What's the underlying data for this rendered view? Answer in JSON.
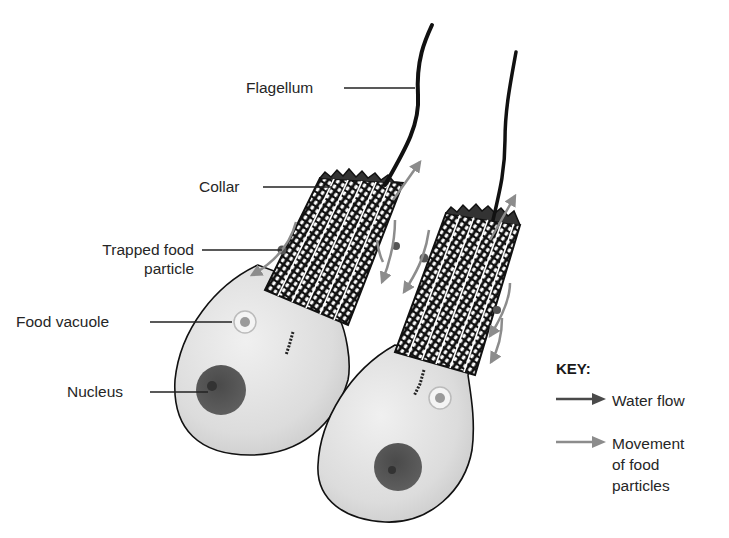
{
  "diagram": {
    "labels": {
      "flagellum": "Flagellum",
      "collar": "Collar",
      "trapped_food_line1": "Trapped food",
      "trapped_food_line2": "particle",
      "food_vacuole": "Food vacuole",
      "nucleus": "Nucleus"
    },
    "key": {
      "title": "KEY:",
      "items": [
        {
          "label": "Water flow",
          "color": "#4a4a4a",
          "icon": "dark-arrow-icon"
        },
        {
          "label": "Movement\nof food\nparticles",
          "color": "#8c8c8c",
          "icon": "gray-arrow-icon"
        }
      ]
    },
    "colors": {
      "cell_fill": "#e4e4e4",
      "outline": "#111111",
      "nucleus": "#555555",
      "vacuole_ring": "#f2f2f2",
      "vacuole_center": "#9a9a9a",
      "water_flow": "#4a4a4a",
      "food_movement": "#8c8c8c"
    }
  }
}
